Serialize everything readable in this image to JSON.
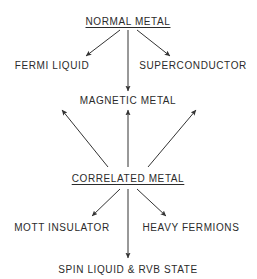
{
  "figure": {
    "kind": "flow-diagram",
    "background_color": "#ffffff",
    "stroke_color": "#333333",
    "text_color": "#2b2b2b",
    "width": 257,
    "height": 279
  },
  "nodes": [
    {
      "id": "normal-metal",
      "label": "NORMAL  METAL",
      "underlined": true,
      "x": 128,
      "y": 22
    },
    {
      "id": "fermi-liquid",
      "label": "FERMI  LIQUID",
      "underlined": false,
      "x": 52,
      "y": 66
    },
    {
      "id": "superconductor",
      "label": "SUPERCONDUCTOR",
      "underlined": false,
      "x": 193,
      "y": 66
    },
    {
      "id": "magnetic-metal",
      "label": "MAGNETIC  METAL",
      "underlined": false,
      "x": 128,
      "y": 101
    },
    {
      "id": "correlated-metal",
      "label": "CORRELATED  METAL",
      "underlined": true,
      "x": 128,
      "y": 179
    },
    {
      "id": "mott-insulator",
      "label": "MOTT  INSULATOR",
      "underlined": false,
      "x": 62,
      "y": 228
    },
    {
      "id": "heavy-fermions",
      "label": "HEAVY  FERMIONS",
      "underlined": false,
      "x": 191,
      "y": 228
    },
    {
      "id": "spin-liquid-rvb",
      "label": "SPIN  LIQUID  &  RVB  STATE",
      "underlined": false,
      "x": 128,
      "y": 270
    }
  ],
  "arrows": [
    {
      "id": "normal-to-fermi",
      "from": "normal-metal",
      "to": "fermi-liquid",
      "x1": 120,
      "y1": 30,
      "x2": 86,
      "y2": 56
    },
    {
      "id": "normal-to-superconductor",
      "from": "normal-metal",
      "to": "superconductor",
      "x1": 137,
      "y1": 30,
      "x2": 170,
      "y2": 56
    },
    {
      "id": "normal-to-magnetic",
      "from": "normal-metal",
      "to": "magnetic-metal",
      "x1": 128,
      "y1": 30,
      "x2": 128,
      "y2": 91
    },
    {
      "id": "correlated-to-magnetic-left",
      "from": "correlated-metal",
      "to": "magnetic-metal",
      "x1": 108,
      "y1": 167,
      "x2": 62,
      "y2": 110
    },
    {
      "id": "correlated-to-magnetic-mid",
      "from": "correlated-metal",
      "to": "magnetic-metal",
      "x1": 128,
      "y1": 167,
      "x2": 128,
      "y2": 110
    },
    {
      "id": "correlated-to-magnetic-right",
      "from": "correlated-metal",
      "to": "magnetic-metal",
      "x1": 148,
      "y1": 167,
      "x2": 196,
      "y2": 110
    },
    {
      "id": "correlated-to-mott",
      "from": "correlated-metal",
      "to": "mott-insulator",
      "x1": 120,
      "y1": 189,
      "x2": 92,
      "y2": 216
    },
    {
      "id": "correlated-to-heavy",
      "from": "correlated-metal",
      "to": "heavy-fermions",
      "x1": 137,
      "y1": 189,
      "x2": 166,
      "y2": 216
    },
    {
      "id": "correlated-to-spin",
      "from": "correlated-metal",
      "to": "spin-liquid-rvb",
      "x1": 128,
      "y1": 189,
      "x2": 128,
      "y2": 258
    }
  ],
  "chart_data": {
    "type": "diagram",
    "title": "",
    "levels": [
      {
        "level": 0,
        "items": [
          "NORMAL  METAL"
        ]
      },
      {
        "level": 1,
        "items": [
          "FERMI  LIQUID",
          "SUPERCONDUCTOR"
        ]
      },
      {
        "level": 2,
        "items": [
          "MAGNETIC  METAL"
        ]
      },
      {
        "level": 3,
        "items": [
          "CORRELATED  METAL"
        ]
      },
      {
        "level": 4,
        "items": [
          "MOTT  INSULATOR",
          "HEAVY  FERMIONS"
        ]
      },
      {
        "level": 5,
        "items": [
          "SPIN  LIQUID  &  RVB  STATE"
        ]
      }
    ],
    "edges": [
      [
        "NORMAL  METAL",
        "FERMI  LIQUID"
      ],
      [
        "NORMAL  METAL",
        "SUPERCONDUCTOR"
      ],
      [
        "NORMAL  METAL",
        "MAGNETIC  METAL"
      ],
      [
        "CORRELATED  METAL",
        "MAGNETIC  METAL"
      ],
      [
        "CORRELATED  METAL",
        "MOTT  INSULATOR"
      ],
      [
        "CORRELATED  METAL",
        "HEAVY  FERMIONS"
      ],
      [
        "CORRELATED  METAL",
        "SPIN  LIQUID  &  RVB  STATE"
      ]
    ]
  }
}
